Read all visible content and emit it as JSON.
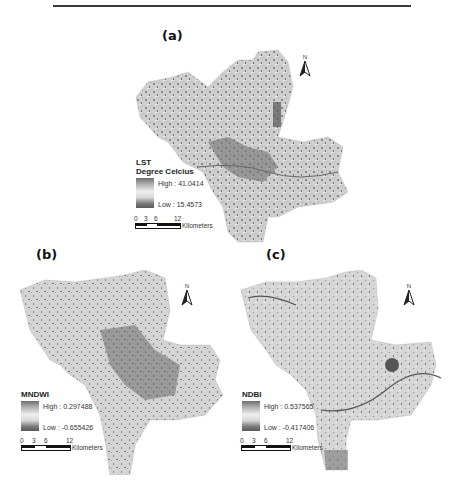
{
  "figure": {
    "panels": [
      {
        "label": "(a)",
        "legend_title_1": "LST",
        "legend_title_2": "Degree Celcius",
        "high": "High : 41.0414",
        "low": "Low : 15.4573",
        "north": "N",
        "scale": {
          "ticks": [
            "0",
            "3",
            "6",
            "12"
          ],
          "unit": "Kilometers"
        }
      },
      {
        "label": "(b)",
        "legend_title_1": "MNDWI",
        "high": "High : 0.297488",
        "low": "Low : -0.655426",
        "north": "N",
        "scale": {
          "ticks": [
            "0",
            "3",
            "6",
            "12"
          ],
          "unit": "Kilometers"
        }
      },
      {
        "label": "(c)",
        "legend_title_1": "NDBI",
        "high": "High : 0.537565",
        "low": "Low : -0.417406",
        "north": "N",
        "scale": {
          "ticks": [
            "0",
            "3",
            "6",
            "12"
          ],
          "unit": "Kilometers"
        }
      }
    ]
  }
}
